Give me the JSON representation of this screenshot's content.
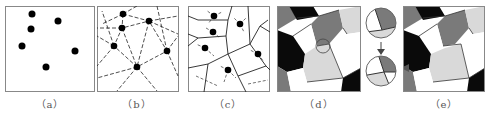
{
  "figure": {
    "panels": [
      {
        "id": "a",
        "label": "（a）",
        "description": "seed points"
      },
      {
        "id": "b",
        "label": "（b）",
        "description": "Delaunay-like dashed connections"
      },
      {
        "id": "c",
        "label": "（c）",
        "description": "Voronoi cells from bisectors"
      },
      {
        "id": "d",
        "label": "（d）",
        "description": "shaded grain map with highlighted junction"
      },
      {
        "id": "e",
        "label": "（e）",
        "description": "modified grain map"
      }
    ],
    "colors": {
      "black": "#0a0a0a",
      "dark_gray": "#7a7a7a",
      "light_gray": "#d9d9d9",
      "white": "#ffffff",
      "frame": "#8a8a8a"
    }
  }
}
